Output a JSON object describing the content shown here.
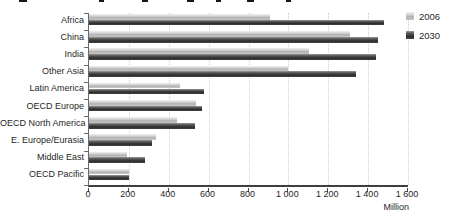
{
  "chart_data": {
    "type": "bar",
    "orientation": "horizontal",
    "title_visible": false,
    "categories": [
      "Africa",
      "China",
      "India",
      "Other Asia",
      "Latin America",
      "OECD Europe",
      "OECD North America",
      "E. Europe/Eurasia",
      "Middle East",
      "OECD Pacific"
    ],
    "series": [
      {
        "name": "2006",
        "color_top": "#dadada",
        "color_body": "#b2b2b2",
        "values": [
          910,
          1310,
          1105,
          1000,
          455,
          535,
          440,
          335,
          190,
          200
        ]
      },
      {
        "name": "2030",
        "color_top": "#565656",
        "color_body": "#2d2d2d",
        "values": [
          1480,
          1450,
          1440,
          1340,
          575,
          565,
          530,
          315,
          280,
          200
        ]
      }
    ],
    "xlabel": "Million",
    "xlim": [
      0,
      1600
    ],
    "xticks": [
      0,
      200,
      400,
      600,
      800,
      1000,
      1200,
      1400,
      1600
    ],
    "xtick_labels": [
      "0",
      "200",
      "400",
      "600",
      "800",
      "1 000",
      "1 200",
      "1 400",
      "1 600"
    ],
    "grid": "vertical-dotted",
    "gridline_color": "#ccd1cc",
    "legend_position": "top-right"
  },
  "legend": {
    "items": [
      {
        "label": "2006"
      },
      {
        "label": "2030"
      }
    ]
  },
  "axis": {
    "unit_label": "Million"
  }
}
